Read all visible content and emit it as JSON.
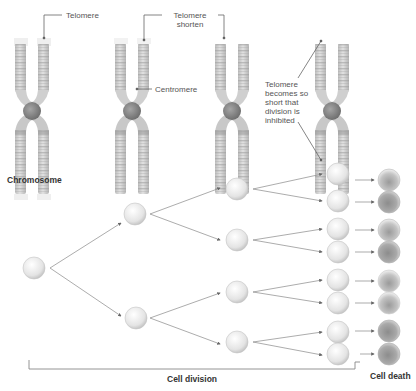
{
  "labels": {
    "telomere": "Telomere",
    "telomere_shorten_1": "Telomere",
    "telomere_shorten_2": "shorten",
    "centromere": "Centromere",
    "inhibited_1": "Telomere",
    "inhibited_2": "becomes so",
    "inhibited_3": "short that",
    "inhibited_4": "division is",
    "inhibited_5": "inhibited",
    "chromosome": "Chromosome",
    "cell_division": "Cell division",
    "cell_death": "Cell death"
  },
  "chromosomes": [
    {
      "name": "chromosome-full-telomere",
      "x": 20,
      "top": 40,
      "bottom": 166
    },
    {
      "name": "chromosome-shortened-1",
      "x": 119,
      "top": 40,
      "bottom": 166
    },
    {
      "name": "chromosome-shortened-2",
      "x": 218,
      "top": 40,
      "bottom": 166
    },
    {
      "name": "chromosome-critically-short",
      "x": 317,
      "top": 40,
      "bottom": 166
    }
  ],
  "tree": {
    "generations": 5,
    "stages": [
      "root cell",
      "generation 1 (2 cells)",
      "generation 2 (4 cells)",
      "generation 3 (8 cells)",
      "dying cells (8)"
    ]
  },
  "colors": {
    "chromosome_band": "#b8b8b8",
    "chromosome_light": "#e6e6e6",
    "centromere": "#8a8a8a",
    "cell_light": "#f2f2f2",
    "cell_dark": "#7a7a7a",
    "line": "#777777"
  }
}
